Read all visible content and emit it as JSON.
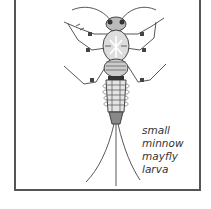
{
  "figure": {
    "caption_lines": [
      "small",
      "minnow",
      "mayfly",
      "larva"
    ],
    "colors": {
      "border": "#555555",
      "ink": "#333333",
      "background": "#ffffff"
    }
  }
}
